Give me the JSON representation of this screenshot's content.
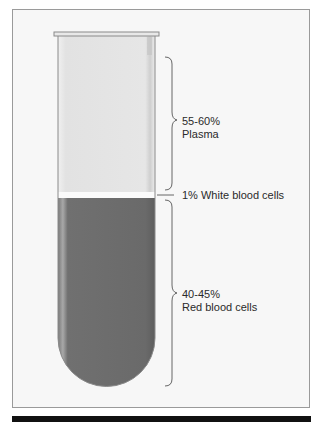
{
  "diagram": {
    "components": [
      {
        "id": "plasma",
        "percent": "55-60%",
        "name": "Plasma",
        "color": "#e6e6e6"
      },
      {
        "id": "wbc",
        "percent": "1%",
        "name": "White blood cells",
        "label": "1% White blood cells",
        "color": "#ffffff"
      },
      {
        "id": "rbc",
        "percent": "40-45%",
        "name": "Red blood cells",
        "color": "#6b6b6b"
      }
    ]
  }
}
